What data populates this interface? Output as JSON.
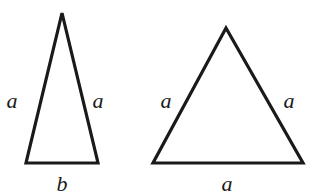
{
  "diagram": {
    "stroke_color": "#1a1a1a",
    "triangles": [
      {
        "name": "isosceles",
        "points": [
          [
            62,
            13
          ],
          [
            26,
            163
          ],
          [
            98,
            163
          ]
        ],
        "labels": {
          "left": "a",
          "right": "a",
          "base": "b"
        }
      },
      {
        "name": "equilateral",
        "points": [
          [
            226,
            28
          ],
          [
            153,
            163
          ],
          [
            303,
            163
          ]
        ],
        "labels": {
          "left": "a",
          "right": "a",
          "base": "a"
        }
      }
    ]
  }
}
